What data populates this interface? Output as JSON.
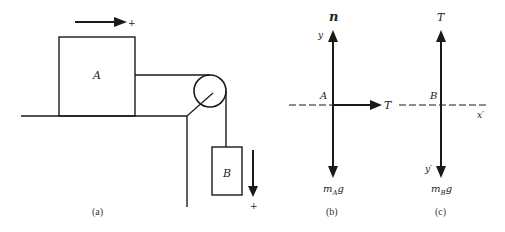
{
  "figure": {
    "panels": [
      {
        "id": "a",
        "caption": "(a)",
        "block_a_label": "A",
        "block_b_label": "B",
        "positive_direction_a": "+",
        "positive_direction_b": "+"
      },
      {
        "id": "b",
        "caption": "(b)",
        "normal_force_label": "n",
        "axis_y_label": "y",
        "origin_label": "A",
        "tension_label": "T",
        "weight_label_main": "m",
        "weight_label_sub": "A",
        "weight_label_tail": "g"
      },
      {
        "id": "c",
        "caption": "(c)",
        "tension_label": "T",
        "origin_label": "B",
        "axis_x_label": "x′",
        "axis_y_label": "y′",
        "weight_label_main": "m",
        "weight_label_sub": "B",
        "weight_label_tail": "g"
      }
    ],
    "colors": {
      "line": "#1a1a1a",
      "background": "#ffffff"
    }
  }
}
